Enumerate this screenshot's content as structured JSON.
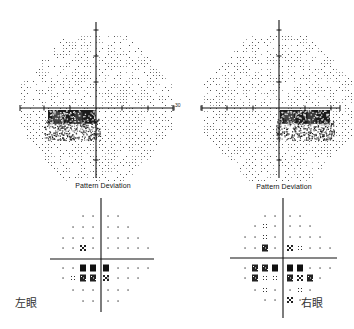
{
  "figure": {
    "type": "visual_field_printout",
    "background": "#ffffff",
    "ink_color": "#111111"
  },
  "left_eye": {
    "label": "左眼",
    "label_pos": [
      30,
      301
    ],
    "grayscale": {
      "center": [
        96,
        108
      ],
      "axis_x": [
        20,
        173
      ],
      "axis_y": [
        22,
        178
      ],
      "scale_label": "30",
      "scale_label_pos": [
        175,
        105
      ],
      "field_radius": 78,
      "tick_spacing": 26,
      "scotoma_rect": [
        48,
        110,
        96,
        135
      ],
      "scotoma_side": "nasal-inferior"
    },
    "pattern_deviation": {
      "title": "Pattern Deviation",
      "title_pos": [
        103,
        187
      ],
      "center": [
        101,
        259
      ],
      "axis_x": [
        50,
        154
      ],
      "axis_y": [
        198,
        312
      ],
      "cols": [
        63,
        73,
        83,
        93,
        108,
        118,
        128,
        138,
        148
      ],
      "rows": [
        216,
        227,
        238,
        248,
        268,
        278,
        290,
        301
      ],
      "marks": [
        {
          "x": 83,
          "y": 248,
          "sym": "checker"
        },
        {
          "x": 83,
          "y": 268,
          "sym": "black"
        },
        {
          "x": 93,
          "y": 268,
          "sym": "black"
        },
        {
          "x": 106,
          "y": 268,
          "sym": "black"
        },
        {
          "x": 73,
          "y": 278,
          "sym": "sparse"
        },
        {
          "x": 83,
          "y": 278,
          "sym": "dense"
        },
        {
          "x": 93,
          "y": 278,
          "sym": "dense"
        },
        {
          "x": 106,
          "y": 278,
          "sym": "checker"
        }
      ]
    }
  },
  "right_eye": {
    "label": "右眼",
    "label_pos": [
      316,
      301
    ],
    "grayscale": {
      "center": [
        279,
        108
      ],
      "axis_x": [
        202,
        340
      ],
      "axis_y": [
        20,
        178
      ],
      "field_radius": 78,
      "tick_spacing": 26,
      "scotoma_rect": [
        280,
        110,
        330,
        135
      ],
      "scotoma_side": "nasal-inferior"
    },
    "pattern_deviation": {
      "title": "Pattern Deviation",
      "title_pos": [
        284,
        188
      ],
      "center": [
        283,
        258
      ],
      "axis_x": [
        230,
        337
      ],
      "axis_y": [
        198,
        318
      ],
      "cols": [
        245,
        255,
        265,
        275,
        290,
        300,
        310,
        320,
        330
      ],
      "rows": [
        216,
        226,
        237,
        248,
        268,
        278,
        290,
        300
      ],
      "marks": [
        {
          "x": 265,
          "y": 226,
          "sym": "sparse"
        },
        {
          "x": 265,
          "y": 237,
          "sym": "sparse"
        },
        {
          "x": 265,
          "y": 248,
          "sym": "dense"
        },
        {
          "x": 290,
          "y": 248,
          "sym": "checker"
        },
        {
          "x": 300,
          "y": 248,
          "sym": "sparse"
        },
        {
          "x": 255,
          "y": 268,
          "sym": "dense"
        },
        {
          "x": 265,
          "y": 268,
          "sym": "dense"
        },
        {
          "x": 275,
          "y": 268,
          "sym": "black"
        },
        {
          "x": 290,
          "y": 268,
          "sym": "black"
        },
        {
          "x": 300,
          "y": 268,
          "sym": "black"
        },
        {
          "x": 255,
          "y": 278,
          "sym": "dense"
        },
        {
          "x": 265,
          "y": 278,
          "sym": "sparse"
        },
        {
          "x": 275,
          "y": 278,
          "sym": "sparse"
        },
        {
          "x": 290,
          "y": 278,
          "sym": "dense"
        },
        {
          "x": 300,
          "y": 278,
          "sym": "checker"
        },
        {
          "x": 310,
          "y": 278,
          "sym": "dense"
        },
        {
          "x": 265,
          "y": 290,
          "sym": "sparse"
        },
        {
          "x": 300,
          "y": 290,
          "sym": "sparse"
        },
        {
          "x": 290,
          "y": 300,
          "sym": "checker"
        }
      ]
    }
  }
}
